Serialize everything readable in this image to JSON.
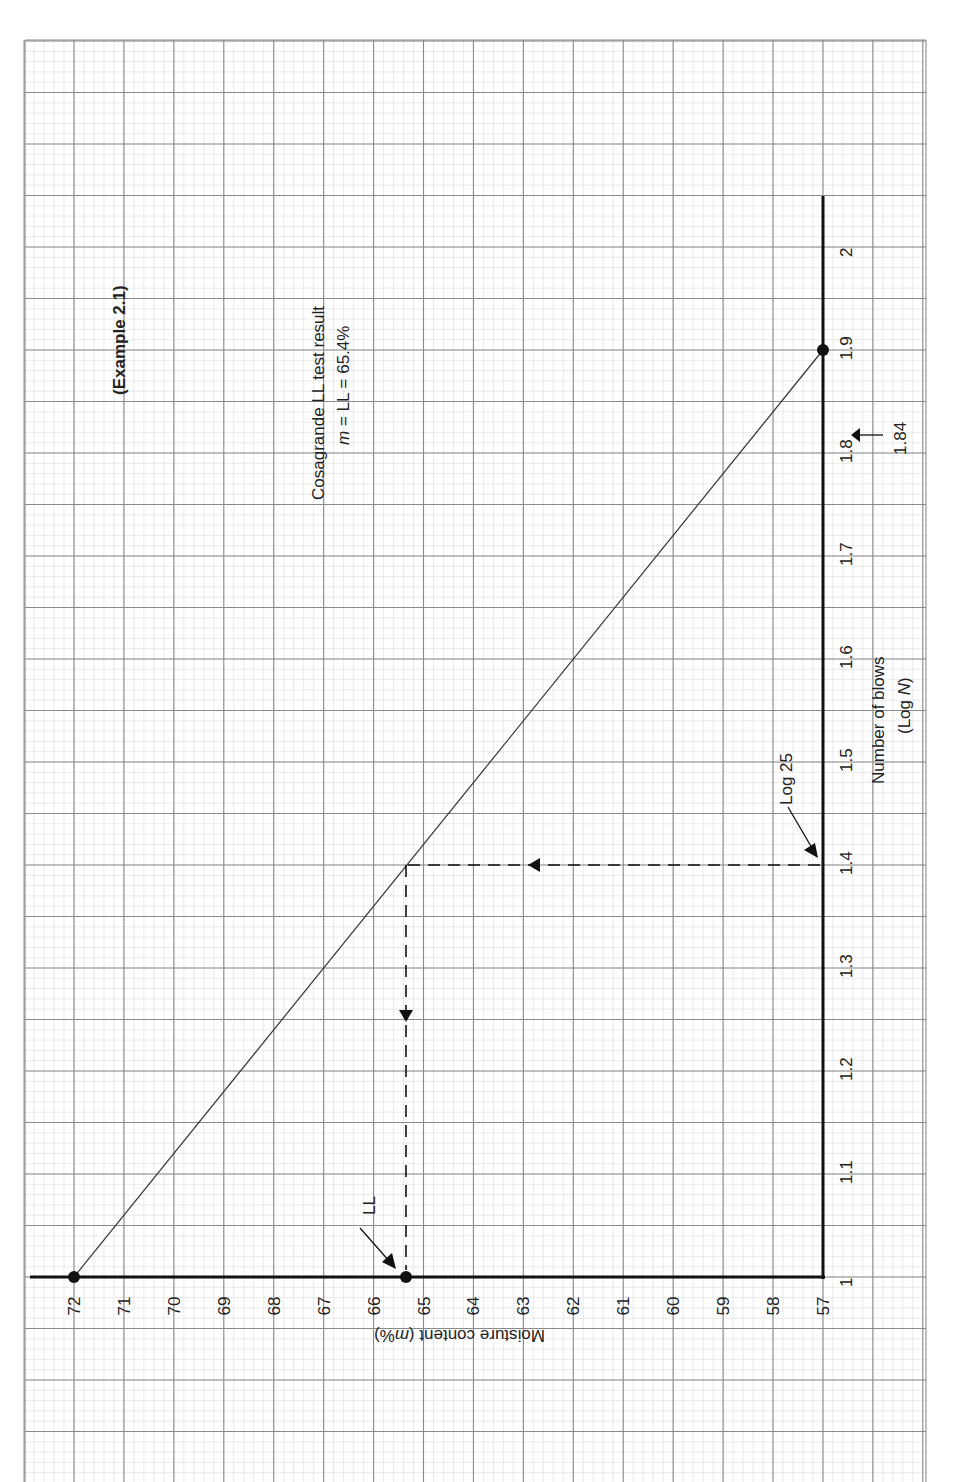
{
  "chart_data": {
    "type": "line",
    "title": "Cosagrande LL test result",
    "subtitle": "m = LL = 65.4%",
    "example_label": "(Example 2.1)",
    "xlabel": "Number of blows",
    "xlabel_sub": "(Log N)",
    "ylabel": "Moisture content (m%)",
    "x_ticks": [
      "1",
      "1.1",
      "1.2",
      "1.3",
      "1.4",
      "1.5",
      "1.6",
      "1.7",
      "1.8",
      "1.9",
      "2"
    ],
    "y_ticks": [
      "72",
      "71",
      "70",
      "69",
      "68",
      "67",
      "66",
      "65",
      "64",
      "63",
      "62",
      "61",
      "60",
      "59",
      "58",
      "57"
    ],
    "xlim": [
      1,
      2
    ],
    "ylim": [
      57,
      72
    ],
    "grid": true,
    "orientation": "rotated 90° (page in landscape)",
    "series": [
      {
        "name": "Flow line",
        "x": [
          1.0,
          1.9
        ],
        "y": [
          72,
          57
        ]
      }
    ],
    "points": [
      {
        "label": "start",
        "x": 1.0,
        "y": 72
      },
      {
        "label": "end",
        "x": 1.9,
        "y": 57
      },
      {
        "label": "LL",
        "x": 1.0,
        "y": 65.4
      }
    ],
    "annotations": [
      {
        "text": "Log 25",
        "x": 1.4,
        "note": "arrow to x-axis at 1.4"
      },
      {
        "text": "1.84",
        "x": 1.84,
        "note": "arrow pointing to x-axis near 1.84"
      },
      {
        "text": "LL",
        "x": 1.0,
        "y": 65.4,
        "note": "arrow to LL point on y-axis"
      }
    ],
    "guide_lines": [
      {
        "type": "vertical",
        "x": 1.4,
        "from_y": 57,
        "to_y": 65.4,
        "style": "dashed"
      },
      {
        "type": "horizontal",
        "y": 65.4,
        "from_x": 1.4,
        "to_x": 1.0,
        "style": "dashed"
      }
    ]
  },
  "labels": {
    "example": "(Example 2.1)",
    "result_line1": "Cosagrande LL test result",
    "result_line2_m": "m",
    "result_line2_rest": " = LL = 65.4%",
    "x_axis_title": "Number of blows",
    "x_axis_sub_open": "(Log ",
    "x_axis_sub_N": "N",
    "x_axis_sub_close": ")",
    "y_axis_title_pre": "Moisture content (",
    "y_axis_title_m": "m",
    "y_axis_title_post": "%)",
    "log25": "Log 25",
    "v184": "1.84",
    "ll": "LL"
  }
}
